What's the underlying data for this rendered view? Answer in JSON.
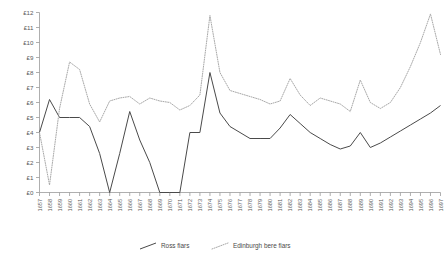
{
  "chart_data": {
    "type": "line",
    "title": "",
    "xlabel": "",
    "ylabel": "",
    "ylim": [
      0,
      12
    ],
    "grid": false,
    "legend_position": "bottom",
    "currency_symbol": "£",
    "y_ticks": [
      0,
      1,
      2,
      3,
      4,
      5,
      6,
      7,
      8,
      9,
      10,
      11,
      12
    ],
    "y_tick_labels": [
      "£0",
      "£1",
      "£2",
      "£3",
      "£4",
      "£5",
      "£6",
      "£7",
      "£8",
      "£9",
      "£10",
      "£11",
      "£12"
    ],
    "categories": [
      "1657",
      "1658",
      "1659",
      "1660",
      "1661",
      "1662",
      "1663",
      "1664",
      "1665",
      "1666",
      "1667",
      "1668",
      "1669",
      "1670",
      "1671",
      "1672",
      "1673",
      "1674",
      "1675",
      "1676",
      "1677",
      "1678",
      "1679",
      "1680",
      "1681",
      "1682",
      "1683",
      "1684",
      "1685",
      "1686",
      "1687",
      "1688",
      "1689",
      "1690",
      "1691",
      "1692",
      "1693",
      "1694",
      "1695",
      "1696",
      "1697"
    ],
    "series": [
      {
        "name": "Ross fiars",
        "style": "solid",
        "color": "#4a4a4a",
        "values": [
          4.0,
          6.2,
          5.0,
          5.0,
          5.0,
          4.4,
          2.6,
          0.0,
          2.6,
          5.4,
          3.5,
          2.0,
          0.0,
          0.0,
          0.0,
          4.0,
          4.0,
          8.0,
          5.3,
          4.4,
          4.0,
          3.6,
          3.6,
          3.6,
          4.3,
          5.2,
          4.6,
          4.0,
          3.6,
          3.2,
          2.9,
          3.1,
          4.0,
          3.0,
          3.3,
          3.7,
          4.1,
          4.5,
          4.9,
          5.3,
          5.8
        ]
      },
      {
        "name": "Edinburgh bere fiars",
        "style": "dotted",
        "color": "#a8a8a8",
        "values": [
          4.0,
          0.5,
          5.6,
          8.7,
          8.2,
          5.9,
          4.7,
          6.1,
          6.3,
          6.4,
          5.9,
          6.3,
          6.1,
          6.0,
          5.5,
          5.8,
          6.5,
          11.8,
          8.0,
          6.8,
          6.6,
          6.4,
          6.2,
          5.9,
          6.1,
          7.6,
          6.5,
          5.8,
          6.3,
          6.1,
          5.9,
          5.4,
          7.5,
          6.0,
          5.6,
          6.0,
          7.0,
          8.4,
          10.0,
          11.9,
          9.2
        ]
      }
    ]
  },
  "legend": {
    "items": [
      {
        "label": "Ross fiars",
        "marker": "solid-line-swatch"
      },
      {
        "label": "Edinburgh bere fiars",
        "marker": "dotted-line-swatch"
      }
    ]
  }
}
